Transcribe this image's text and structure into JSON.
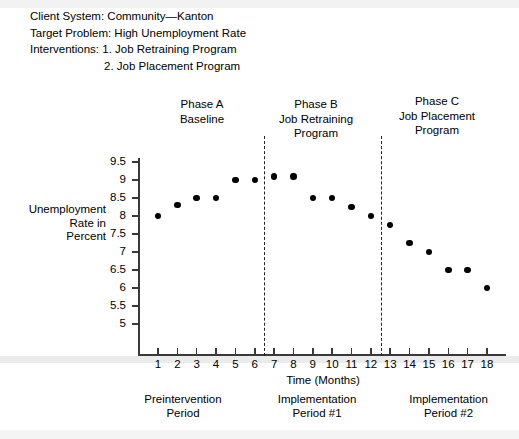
{
  "header": {
    "lines": [
      "Client System: Community—Kanton",
      "Target Problem: High Unemployment Rate",
      "Interventions: 1. Job Retraining Program",
      "2. Job Placement Program"
    ]
  },
  "phases": [
    {
      "name": "Phase A",
      "detail_1": "Baseline",
      "detail_2": ""
    },
    {
      "name": "Phase B",
      "detail_1": "Job Retraining",
      "detail_2": "Program"
    },
    {
      "name": "Phase C",
      "detail_1": "Job Placement",
      "detail_2": "Program"
    }
  ],
  "brackets": [
    {
      "top": "Preintervention",
      "bottom": "Period"
    },
    {
      "top": "Implementation",
      "bottom": "Period #1"
    },
    {
      "top": "Implementation",
      "bottom": "Period #2"
    }
  ],
  "chart_data": {
    "type": "scatter",
    "title": "",
    "xlabel": "Time (Months)",
    "ylabel": "Unemployment Rate in Percent",
    "ylabel_lines": [
      "Unemployment",
      "Rate in",
      "Percent"
    ],
    "x": [
      1,
      2,
      3,
      4,
      5,
      6,
      7,
      8,
      9,
      10,
      11,
      12,
      13,
      14,
      15,
      16,
      17,
      18
    ],
    "values": [
      8.0,
      8.3,
      8.5,
      8.5,
      9.0,
      9.0,
      9.1,
      9.1,
      8.5,
      8.5,
      8.25,
      8.0,
      7.75,
      7.25,
      7.0,
      6.5,
      6.5,
      6.0
    ],
    "categories": [
      "1",
      "2",
      "3",
      "4",
      "5",
      "6",
      "7",
      "8",
      "9",
      "10",
      "11",
      "12",
      "13",
      "14",
      "15",
      "16",
      "17",
      "18"
    ],
    "xlim": [
      0.5,
      18.5
    ],
    "ylim": [
      5,
      9.5
    ],
    "ytick_labels": [
      "9.5",
      "9",
      "8.5",
      "8",
      "7.5",
      "7",
      "6.5",
      "6",
      "5.5",
      "5"
    ],
    "ytick_values": [
      9.5,
      9,
      8.5,
      8,
      7.5,
      7,
      6.5,
      6,
      5.5,
      5
    ],
    "grid": false,
    "legend": "none",
    "marker_color": "#000000",
    "axis_color": "#3a3a3a",
    "phase_dividers": [
      6.5,
      12.5
    ]
  }
}
